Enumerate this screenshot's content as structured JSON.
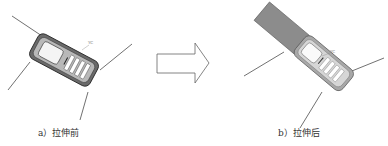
{
  "figure": {
    "panels": [
      {
        "id": "a",
        "caption": "a）拉伸前",
        "label_yc": "YC",
        "state": "before stretching",
        "phone_color": "#555555",
        "screen_color": "#f0f0f0"
      },
      {
        "id": "b",
        "caption": "b）拉伸后",
        "label_yc": "YC",
        "state": "after stretching",
        "phone_color": "#888888",
        "extension_color": "#8a8a8a"
      }
    ],
    "arrow": {
      "direction": "right",
      "stroke": "#666666"
    }
  }
}
